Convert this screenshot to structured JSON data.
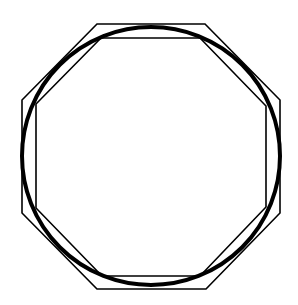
{
  "diagram": {
    "stroke_color": "#000000",
    "background": "#ffffff",
    "circle": {
      "cx": 151,
      "cy": 156,
      "r": 129,
      "stroke_width": 4
    },
    "outer_octagon": {
      "points": "97,24 205,24 280,100 280,213 206,289 97,289 22,213 22,100",
      "stroke_width": 1.6
    },
    "inner_octagon": {
      "points": "101,38 200,38 266,106 266,207 200,276 102,276 36,208 36,104",
      "stroke_width": 1.6
    }
  }
}
